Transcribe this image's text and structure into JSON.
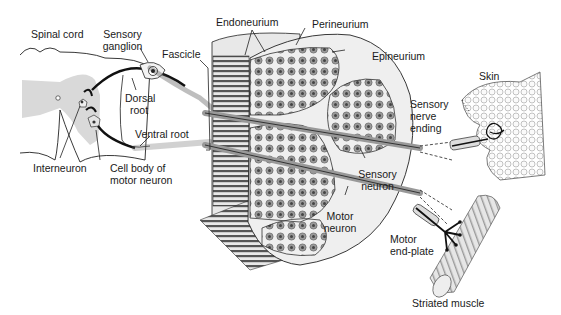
{
  "diagram": {
    "colors": {
      "background": "#ffffff",
      "ink": "#1a1a1a",
      "gray_matter": "#d9d9d9",
      "epineurium": "#efefef",
      "fascicle_fill": "#dcdcdc",
      "axon_dot": "#7a7a7a",
      "fiber_stripes": "#5a5a5a"
    },
    "labels": {
      "spinal_cord": "Spinal cord",
      "sensory_ganglion_1": "Sensory",
      "sensory_ganglion_2": "ganglion",
      "dorsal_root_1": "Dorsal",
      "dorsal_root_2": "root",
      "ventral_root": "Ventral root",
      "interneuron": "Interneuron",
      "cell_body_1": "Cell body of",
      "cell_body_2": "motor neuron",
      "fascicle": "Fascicle",
      "endoneurium": "Endoneurium",
      "perineurium": "Perineurium",
      "epineurium": "Epineurium",
      "sensory_neuron_1": "Sensory",
      "sensory_neuron_2": "neuron",
      "motor_neuron_1": "Motor",
      "motor_neuron_2": "neuron",
      "skin": "Skin",
      "sensory_nerve_ending_1": "Sensory",
      "sensory_nerve_ending_2": "nerve",
      "sensory_nerve_ending_3": "ending",
      "motor_end_plate_1": "Motor",
      "motor_end_plate_2": "end-plate",
      "striated_muscle": "Striated muscle"
    }
  }
}
